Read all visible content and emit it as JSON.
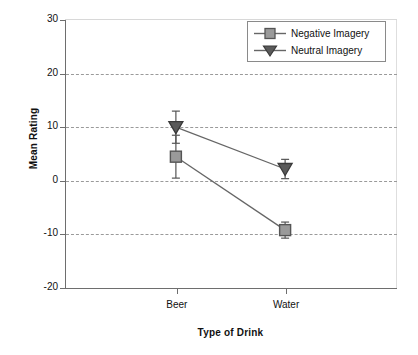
{
  "chart_data": {
    "type": "line",
    "title": "",
    "xlabel": "Type of Drink",
    "ylabel": "Mean Rating",
    "categories": [
      "Beer",
      "Water"
    ],
    "ylim": [
      -20,
      30
    ],
    "yticks": [
      30,
      20,
      10,
      0,
      -10,
      -20
    ],
    "ytick_labels": [
      "30",
      "20",
      "10",
      "0",
      "-10",
      "-20"
    ],
    "grid": "horizontal-dashed",
    "legend_position": "top-right",
    "series": [
      {
        "name": "Negative Imagery",
        "marker": "square",
        "marker_color": "#9a9a9a",
        "marker_edge_color": "#555555",
        "line_color": "#666666",
        "values": [
          4.5,
          -9.2
        ],
        "errors": [
          4.0,
          1.5
        ]
      },
      {
        "name": "Neutral Imagery",
        "marker": "triangle-down",
        "marker_color": "#5a5a5a",
        "marker_edge_color": "#3a3a3a",
        "line_color": "#666666",
        "values": [
          10.0,
          2.2
        ],
        "errors": [
          3.0,
          1.8
        ]
      }
    ]
  },
  "legend": {
    "items": [
      {
        "label": "Negative Imagery"
      },
      {
        "label": "Neutral Imagery"
      }
    ]
  },
  "axes": {
    "y_title": "Mean Rating",
    "x_title": "Type of Drink",
    "y_labels": [
      "30",
      "20",
      "10",
      "0",
      "-10",
      "-20"
    ],
    "x_labels": [
      "Beer",
      "Water"
    ]
  },
  "colors": {
    "axis": "#6e6e6e",
    "grid": "#9a9a9a",
    "line": "#666666",
    "square_fill": "#9a9a9a",
    "triangle_fill": "#5a5a5a",
    "background": "#ffffff"
  }
}
